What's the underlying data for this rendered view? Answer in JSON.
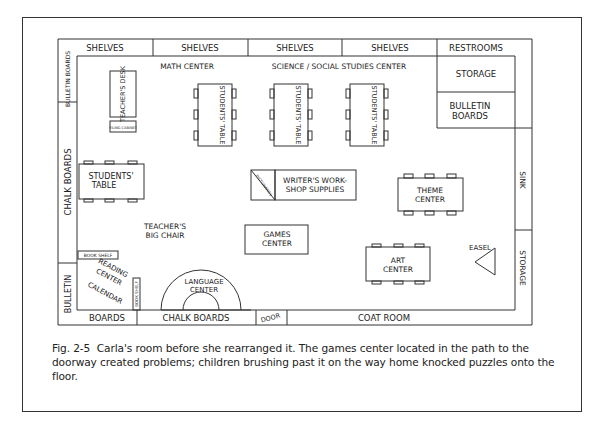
{
  "figure": {
    "walls": {
      "top": [
        "SHELVES",
        "SHELVES",
        "SHELVES",
        "SHELVES",
        "RESTROOMS"
      ],
      "left_top": "BULLETIN BOARDS",
      "left_middle": "CHALK BOARDS",
      "left_bottom": "BULLETIN",
      "bottom": [
        "BOARDS",
        "CHALK BOARDS",
        "DOOR",
        "COAT ROOM"
      ],
      "right": [
        "SINK",
        "STORAGE"
      ]
    },
    "right_upper_block": [
      "STORAGE",
      "BULLETIN BOARDS"
    ],
    "labels": {
      "math_center": "MATH CENTER",
      "science_center": "SCIENCE / SOCIAL STUDIES CENTER",
      "teachers_desk": "TEACHER'S DESK",
      "filing_cabinet": "FILING CABINET",
      "students_table": "STUDENTS' TABLE",
      "students_table_left": "STUDENTS' TABLE",
      "dictionaries": "DICTIONARIES",
      "writers_workshop": [
        "WRITER'S WORK-",
        "SHOP SUPPLIES"
      ],
      "theme_center": [
        "THEME",
        "CENTER"
      ],
      "teachers_big_chair": [
        "TEACHER'S",
        "BIG CHAIR"
      ],
      "games_center": [
        "GAMES",
        "CENTER"
      ],
      "art_center": [
        "ART",
        "CENTER"
      ],
      "easel": "EASEL",
      "book_shelf_horizontal": "BOOK SHELF",
      "book_shelf_vertical": "BOOK SHELF",
      "reading_center": [
        "READING",
        "CENTER"
      ],
      "calendar": "CALENDAR",
      "language_center": [
        "LANGUAGE",
        "CENTER"
      ]
    }
  },
  "caption": {
    "fig_number": "Fig. 2-5",
    "text": "Carla's room before she rearranged it. The games center located in the path to the doorway created problems; children brushing past it on the way home knocked puzzles onto the floor."
  }
}
